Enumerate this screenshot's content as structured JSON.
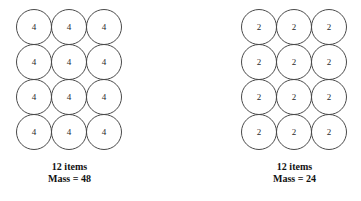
{
  "diagram": {
    "background_color": "#ffffff",
    "circle_stroke_color": "#4a4a4a",
    "text_color": "#111111",
    "groups": [
      {
        "id": "left",
        "item_value": "4",
        "columns": 3,
        "rows": 4,
        "cells": [
          "4",
          "4",
          "4",
          "4",
          "4",
          "4",
          "4",
          "4",
          "4",
          "4",
          "4",
          "4"
        ],
        "caption_line1": "12 items",
        "caption_line2": "Mass = 48",
        "item_count": 12,
        "mass": 48
      },
      {
        "id": "right",
        "item_value": "2",
        "columns": 3,
        "rows": 4,
        "cells": [
          "2",
          "2",
          "2",
          "2",
          "2",
          "2",
          "2",
          "2",
          "2",
          "2",
          "2",
          "2"
        ],
        "caption_line1": "12 items",
        "caption_line2": "Mass = 24",
        "item_count": 12,
        "mass": 24
      }
    ]
  }
}
